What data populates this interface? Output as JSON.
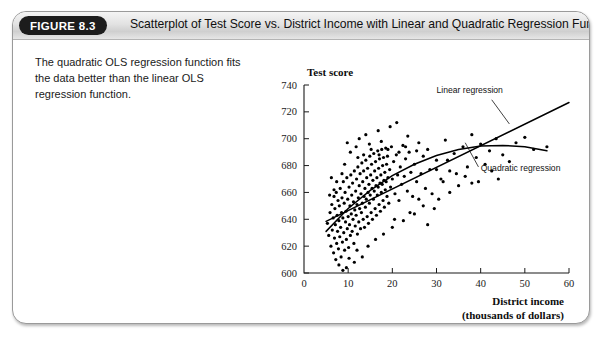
{
  "figure": {
    "badge": "FIGURE 8.3",
    "title": "Scatterplot of Test Score vs. District Income with Linear and Quadratic Regression Functions",
    "caption": "The quadratic OLS regression function fits the data better than the linear OLS regression function."
  },
  "chart_data": {
    "type": "scatter",
    "title": "",
    "xlabel": "District income",
    "xlabel_sub": "(thousands of dollars)",
    "ylabel": "Test score",
    "xlim": [
      0,
      60
    ],
    "ylim": [
      600,
      740
    ],
    "xticks": [
      0,
      10,
      20,
      30,
      40,
      50,
      60
    ],
    "yticks": [
      600,
      620,
      640,
      660,
      680,
      700,
      720,
      740
    ],
    "grid": false,
    "legend_position": "none",
    "annotations": [
      {
        "text": "Linear regression",
        "x": 30,
        "y": 734
      },
      {
        "text": "Quadratic regression",
        "x": 40,
        "y": 676
      }
    ],
    "series": [
      {
        "name": "Linear regression",
        "type": "line",
        "x": [
          5,
          60
        ],
        "y": [
          638.5,
          727.0
        ]
      },
      {
        "name": "Quadratic regression",
        "type": "line",
        "x": [
          5,
          10,
          15,
          20,
          25,
          30,
          35,
          40,
          45,
          50,
          55
        ],
        "y": [
          631.0,
          648.0,
          661.5,
          672.5,
          681.0,
          687.5,
          692.0,
          694.5,
          695.0,
          694.0,
          691.0
        ]
      },
      {
        "name": "Districts",
        "type": "scatter",
        "points": [
          [
            5.3,
            637
          ],
          [
            5.6,
            628
          ],
          [
            5.9,
            645
          ],
          [
            6.1,
            620
          ],
          [
            6.3,
            651
          ],
          [
            6.4,
            632
          ],
          [
            6.6,
            641
          ],
          [
            6.7,
            615
          ],
          [
            6.8,
            657
          ],
          [
            6.9,
            626
          ],
          [
            7.0,
            648
          ],
          [
            7.1,
            636
          ],
          [
            7.2,
            610
          ],
          [
            7.3,
            660
          ],
          [
            7.4,
            622
          ],
          [
            7.5,
            643
          ],
          [
            7.6,
            631
          ],
          [
            7.7,
            654
          ],
          [
            7.8,
            618
          ],
          [
            7.9,
            639
          ],
          [
            8.0,
            650
          ],
          [
            8.1,
            627
          ],
          [
            8.2,
            663
          ],
          [
            8.3,
            634
          ],
          [
            8.4,
            612
          ],
          [
            8.5,
            645
          ],
          [
            8.6,
            656
          ],
          [
            8.7,
            623
          ],
          [
            8.8,
            641
          ],
          [
            8.9,
            668
          ],
          [
            9.0,
            630
          ],
          [
            9.1,
            652
          ],
          [
            9.2,
            617
          ],
          [
            9.3,
            660
          ],
          [
            9.4,
            638
          ],
          [
            9.5,
            646
          ],
          [
            9.6,
            625
          ],
          [
            9.7,
            671
          ],
          [
            9.8,
            633
          ],
          [
            9.9,
            655
          ],
          [
            10.0,
            642
          ],
          [
            10.1,
            619
          ],
          [
            10.2,
            664
          ],
          [
            10.3,
            636
          ],
          [
            10.4,
            650
          ],
          [
            10.5,
            628
          ],
          [
            10.6,
            673
          ],
          [
            10.7,
            644
          ],
          [
            10.8,
            658
          ],
          [
            10.9,
            631
          ],
          [
            11.0,
            667
          ],
          [
            11.1,
            640
          ],
          [
            11.2,
            653
          ],
          [
            11.3,
            622
          ],
          [
            11.4,
            676
          ],
          [
            11.5,
            647
          ],
          [
            11.6,
            635
          ],
          [
            11.7,
            661
          ],
          [
            11.8,
            643
          ],
          [
            11.9,
            670
          ],
          [
            12.0,
            651
          ],
          [
            12.1,
            629
          ],
          [
            12.2,
            679
          ],
          [
            12.3,
            656
          ],
          [
            12.4,
            638
          ],
          [
            12.5,
            665
          ],
          [
            12.6,
            648
          ],
          [
            12.7,
            674
          ],
          [
            12.8,
            633
          ],
          [
            12.9,
            659
          ],
          [
            13.0,
            645
          ],
          [
            13.1,
            682
          ],
          [
            13.2,
            652
          ],
          [
            13.3,
            668
          ],
          [
            13.4,
            640
          ],
          [
            13.5,
            676
          ],
          [
            13.6,
            657
          ],
          [
            13.7,
            634
          ],
          [
            13.8,
            663
          ],
          [
            13.9,
            649
          ],
          [
            14.0,
            684
          ],
          [
            14.1,
            655
          ],
          [
            14.2,
            671
          ],
          [
            14.3,
            642
          ],
          [
            14.4,
            678
          ],
          [
            14.5,
            660
          ],
          [
            14.6,
            637
          ],
          [
            14.7,
            666
          ],
          [
            14.8,
            652
          ],
          [
            14.9,
            687
          ],
          [
            15.0,
            658
          ],
          [
            15.1,
            673
          ],
          [
            15.2,
            645
          ],
          [
            15.3,
            681
          ],
          [
            15.4,
            663
          ],
          [
            15.5,
            640
          ],
          [
            15.6,
            669
          ],
          [
            15.7,
            655
          ],
          [
            15.8,
            689
          ],
          [
            15.9,
            661
          ],
          [
            16.0,
            676
          ],
          [
            16.1,
            648
          ],
          [
            16.2,
            683
          ],
          [
            16.3,
            665
          ],
          [
            16.4,
            643
          ],
          [
            16.5,
            671
          ],
          [
            16.6,
            658
          ],
          [
            16.7,
            691
          ],
          [
            16.8,
            664
          ],
          [
            16.9,
            678
          ],
          [
            17.0,
            651
          ],
          [
            17.1,
            685
          ],
          [
            17.2,
            667
          ],
          [
            17.3,
            646
          ],
          [
            17.4,
            673
          ],
          [
            17.5,
            660
          ],
          [
            17.6,
            692
          ],
          [
            17.7,
            666
          ],
          [
            17.8,
            680
          ],
          [
            17.9,
            654
          ],
          [
            18.0,
            686
          ],
          [
            18.1,
            669
          ],
          [
            18.2,
            649
          ],
          [
            18.3,
            675
          ],
          [
            18.4,
            662
          ],
          [
            18.5,
            693
          ],
          [
            18.6,
            668
          ],
          [
            18.7,
            681
          ],
          [
            18.8,
            657
          ],
          [
            18.9,
            687
          ],
          [
            19.0,
            671
          ],
          [
            19.2,
            652
          ],
          [
            19.4,
            677
          ],
          [
            19.6,
            664
          ],
          [
            19.8,
            694
          ],
          [
            20.0,
            670
          ],
          [
            20.3,
            683
          ],
          [
            20.6,
            659
          ],
          [
            20.9,
            688
          ],
          [
            21.2,
            673
          ],
          [
            21.5,
            654
          ],
          [
            21.8,
            679
          ],
          [
            22.1,
            666
          ],
          [
            22.4,
            695
          ],
          [
            22.7,
            672
          ],
          [
            23.0,
            685
          ],
          [
            23.4,
            661
          ],
          [
            23.8,
            690
          ],
          [
            24.2,
            675
          ],
          [
            24.6,
            657
          ],
          [
            25.0,
            681
          ],
          [
            25.5,
            668
          ],
          [
            26.0,
            697
          ],
          [
            26.5,
            674
          ],
          [
            27.0,
            687
          ],
          [
            27.5,
            663
          ],
          [
            28.0,
            692
          ],
          [
            28.5,
            677
          ],
          [
            29.0,
            659
          ],
          [
            30.0,
            684
          ],
          [
            31.0,
            670
          ],
          [
            32.0,
            699
          ],
          [
            33.0,
            676
          ],
          [
            34.0,
            689
          ],
          [
            35.0,
            665
          ],
          [
            36.0,
            694
          ],
          [
            37.0,
            679
          ],
          [
            38.0,
            703
          ],
          [
            39.0,
            686
          ],
          [
            40.0,
            696
          ],
          [
            41.0,
            681
          ],
          [
            42.0,
            691
          ],
          [
            43.5,
            700
          ],
          [
            45.0,
            688
          ],
          [
            46.5,
            683
          ],
          [
            48.0,
            697
          ],
          [
            50.0,
            701
          ],
          [
            52.0,
            692
          ],
          [
            55.0,
            694
          ],
          [
            7.9,
            606
          ],
          [
            9.6,
            604
          ],
          [
            11.4,
            608
          ],
          [
            13.2,
            612
          ],
          [
            8.8,
            602
          ],
          [
            10.2,
            611
          ],
          [
            12.0,
            617
          ],
          [
            14.5,
            620
          ],
          [
            16.2,
            625
          ],
          [
            18.0,
            629
          ],
          [
            20.0,
            634
          ],
          [
            22.5,
            639
          ],
          [
            25.0,
            644
          ],
          [
            27.0,
            650
          ],
          [
            12.5,
            700
          ],
          [
            14.0,
            703
          ],
          [
            16.8,
            706
          ],
          [
            19.5,
            709
          ],
          [
            21.0,
            712
          ],
          [
            23.5,
            702
          ],
          [
            17.5,
            698
          ],
          [
            26.0,
            655
          ],
          [
            29.5,
            648
          ],
          [
            31.5,
            668
          ],
          [
            24.0,
            645
          ],
          [
            20.5,
            640
          ],
          [
            33.0,
            660
          ],
          [
            36.5,
            672
          ],
          [
            39.5,
            668
          ],
          [
            42.5,
            676
          ],
          [
            44.0,
            670
          ],
          [
            28.0,
            636
          ],
          [
            30.5,
            655
          ],
          [
            34.5,
            674
          ],
          [
            38.0,
            667
          ],
          [
            10.5,
            690
          ],
          [
            11.8,
            694
          ],
          [
            13.5,
            688
          ],
          [
            15.2,
            692
          ],
          [
            9.2,
            681
          ],
          [
            8.6,
            674
          ],
          [
            7.4,
            668
          ],
          [
            6.8,
            662
          ],
          [
            6.2,
            671
          ],
          [
            5.8,
            658
          ],
          [
            9.8,
            697
          ],
          [
            12.2,
            686
          ],
          [
            14.8,
            696
          ],
          [
            17.0,
            688
          ],
          [
            19.0,
            692
          ],
          [
            21.5,
            690
          ],
          [
            23.0,
            694
          ],
          [
            25.5,
            691
          ],
          [
            30.0,
            677
          ],
          [
            32.5,
            684
          ]
        ]
      }
    ]
  }
}
